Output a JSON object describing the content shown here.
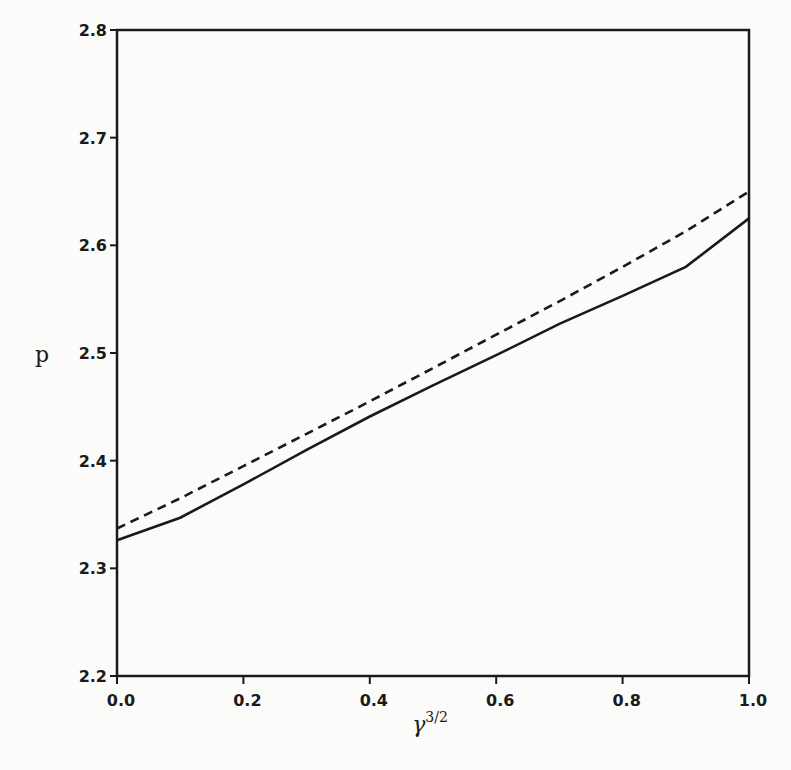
{
  "chart_data": {
    "type": "line",
    "title": "",
    "xlabel": "γ^{3/2}",
    "xlabel_base": "γ",
    "xlabel_sup": "3/2",
    "ylabel": "p",
    "xlim": [
      0.0,
      1.0
    ],
    "ylim": [
      2.2,
      2.8
    ],
    "xticks": [
      "0.0",
      "0.2",
      "0.4",
      "0.6",
      "0.8",
      "1.0"
    ],
    "yticks": [
      "2.2",
      "2.3",
      "2.4",
      "2.5",
      "2.6",
      "2.7",
      "2.8"
    ],
    "grid": false,
    "legend": null,
    "series": [
      {
        "name": "solid",
        "style": "solid",
        "x": [
          0.0,
          0.1,
          0.2,
          0.3,
          0.4,
          0.5,
          0.6,
          0.7,
          0.8,
          0.9,
          1.0
        ],
        "values": [
          2.326,
          2.347,
          2.378,
          2.41,
          2.441,
          2.47,
          2.498,
          2.527,
          2.553,
          2.58,
          2.625
        ]
      },
      {
        "name": "dashed",
        "style": "dashed",
        "x": [
          0.0,
          0.1,
          0.2,
          0.3,
          0.4,
          0.5,
          0.6,
          0.7,
          0.8,
          0.9,
          1.0
        ],
        "values": [
          2.337,
          2.365,
          2.395,
          2.425,
          2.455,
          2.486,
          2.517,
          2.548,
          2.58,
          2.613,
          2.65
        ]
      }
    ]
  }
}
